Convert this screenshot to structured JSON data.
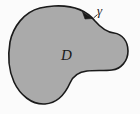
{
  "figure": {
    "type": "math-region-diagram",
    "background_color": "#fbfbfb",
    "region": {
      "label": "D",
      "fill_color": "#aaaaaa",
      "name": "region-d"
    },
    "boundary": {
      "label": "γ",
      "stroke_color": "#1a1a1a",
      "stroke_width": 1.6,
      "name": "boundary-curve-gamma",
      "closed": true
    },
    "orientation_arrow": {
      "name": "orientation-arrow",
      "color": "#1a1a1a",
      "direction": "clockwise-at-top",
      "position_x": 88,
      "position_y": 16
    }
  }
}
